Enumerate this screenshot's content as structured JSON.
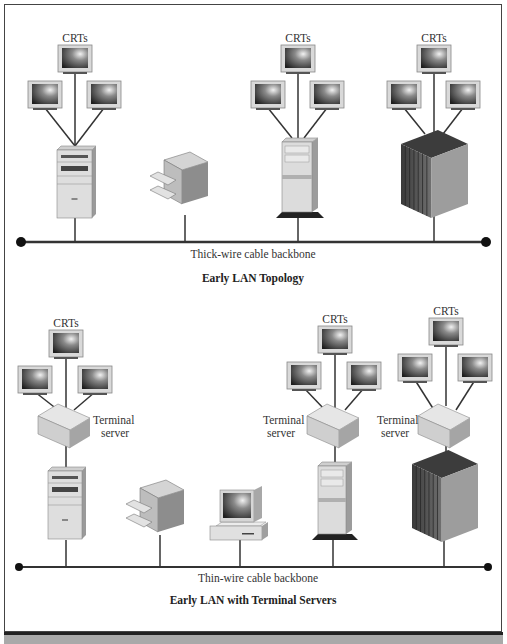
{
  "diagrams": [
    {
      "title": "Early LAN Topology",
      "backbone_label": "Thick-wire cable backbone",
      "groups": [
        {
          "label": "CRTs",
          "host": "tower-server",
          "terminal_server": false
        },
        {
          "label": "",
          "host": "printer",
          "terminal_server": false
        },
        {
          "label": "CRTs",
          "host": "minitower-server",
          "terminal_server": false
        },
        {
          "label": "CRTs",
          "host": "mainframe",
          "terminal_server": false
        }
      ]
    },
    {
      "title": "Early LAN with Terminal Servers",
      "backbone_label": "Thin-wire cable backbone",
      "terminal_server_label": "Terminal server",
      "groups": [
        {
          "label": "CRTs",
          "host": "tower-server",
          "terminal_server": true
        },
        {
          "label": "",
          "host": "printer",
          "terminal_server": false
        },
        {
          "label": "",
          "host": "desktop-pc",
          "terminal_server": false
        },
        {
          "label": "CRTs",
          "host": "minitower-server",
          "terminal_server": true
        },
        {
          "label": "CRTs",
          "host": "mainframe",
          "terminal_server": true
        }
      ]
    }
  ],
  "labels": {
    "crts": "CRTs",
    "terminal": "Terminal",
    "server": "server",
    "thick_backbone": "Thick-wire cable backbone",
    "thin_backbone": "Thin-wire cable backbone",
    "title_top": "Early LAN Topology",
    "title_bottom": "Early LAN with Terminal Servers"
  }
}
